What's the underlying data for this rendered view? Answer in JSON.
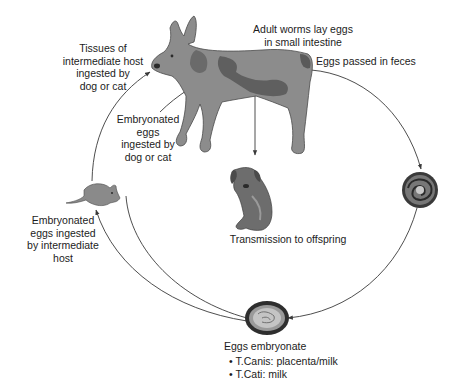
{
  "diagram": {
    "type": "life-cycle",
    "colors": {
      "line": "#3a3a3a",
      "animal_fill": "#8a8a8a",
      "animal_dark": "#5e5e5e",
      "egg_outer": "#2e2e2e",
      "egg_inner": "#bdbdbd",
      "text": "#1c1c1c"
    },
    "nodes": {
      "adult_dog": {
        "icon": "dog-icon",
        "label_lines": [
          "Adult worms lay eggs",
          "in small intestine"
        ]
      },
      "feces_egg": {
        "icon": "egg-icon",
        "label_lines": [
          "Eggs passed in feces"
        ]
      },
      "embryonated_egg": {
        "icon": "embryonated-egg-icon",
        "label_lines": [
          "Eggs embryonate"
        ],
        "bullets": [
          "T.Canis: placenta/milk",
          "T.Cati: milk"
        ]
      },
      "puppy": {
        "icon": "puppy-icon",
        "label_lines": [
          "Transmission to offspring"
        ]
      },
      "mouse": {
        "icon": "mouse-icon",
        "label_lines": [
          "Embryonated",
          "eggs ingested",
          "by intermediate",
          "host"
        ]
      },
      "tissues_label": {
        "label_lines": [
          "Tissues of",
          "intermediate host",
          "ingested by",
          "dog or cat"
        ]
      },
      "direct_ingestion_label": {
        "label_lines": [
          "Embryonated",
          "eggs",
          "ingested by",
          "dog or cat"
        ]
      }
    },
    "edges": [
      {
        "from": "adult_dog",
        "to": "feces_egg"
      },
      {
        "from": "feces_egg",
        "to": "embryonated_egg"
      },
      {
        "from": "embryonated_egg",
        "to": "mouse"
      },
      {
        "from": "embryonated_egg",
        "to": "adult_dog"
      },
      {
        "from": "mouse",
        "to": "adult_dog"
      },
      {
        "from": "adult_dog",
        "to": "puppy"
      }
    ]
  }
}
